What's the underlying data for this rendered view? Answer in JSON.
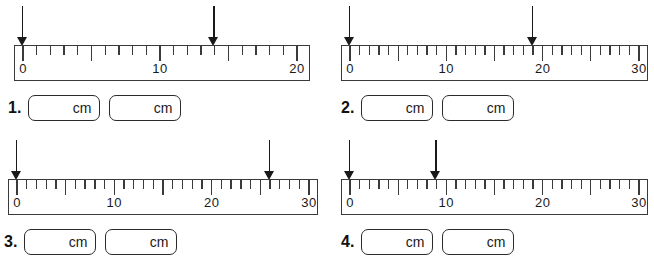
{
  "worksheet": {
    "unit_label": "cm",
    "problems": [
      {
        "number": "1.",
        "ruler": {
          "min": 0,
          "max": 20,
          "tick_step": 1,
          "major_step": 5,
          "labels": [
            {
              "value": 0,
              "text": "0"
            },
            {
              "value": 10,
              "text": "10"
            },
            {
              "value": 20,
              "text": "20"
            }
          ]
        },
        "arrows": [
          0,
          14
        ],
        "answers": [
          {
            "value": "",
            "unit": "cm"
          },
          {
            "value": "",
            "unit": "cm"
          }
        ]
      },
      {
        "number": "2.",
        "ruler": {
          "min": 0,
          "max": 30,
          "tick_step": 1,
          "major_step": 5,
          "labels": [
            {
              "value": 0,
              "text": "0"
            },
            {
              "value": 10,
              "text": "10"
            },
            {
              "value": 20,
              "text": "20"
            },
            {
              "value": 30,
              "text": "30"
            }
          ]
        },
        "arrows": [
          0,
          19
        ],
        "answers": [
          {
            "value": "",
            "unit": "cm"
          },
          {
            "value": "",
            "unit": "cm"
          }
        ]
      },
      {
        "number": "3.",
        "ruler": {
          "min": 0,
          "max": 30,
          "tick_step": 1,
          "major_step": 5,
          "labels": [
            {
              "value": 0,
              "text": "0"
            },
            {
              "value": 10,
              "text": "10"
            },
            {
              "value": 20,
              "text": "20"
            },
            {
              "value": 30,
              "text": "30"
            }
          ]
        },
        "arrows": [
          0,
          26
        ],
        "answers": [
          {
            "value": "",
            "unit": "cm"
          },
          {
            "value": "",
            "unit": "cm"
          }
        ]
      },
      {
        "number": "4.",
        "ruler": {
          "min": 0,
          "max": 30,
          "tick_step": 1,
          "major_step": 5,
          "labels": [
            {
              "value": 0,
              "text": "0"
            },
            {
              "value": 10,
              "text": "10"
            },
            {
              "value": 20,
              "text": "20"
            },
            {
              "value": 30,
              "text": "30"
            }
          ]
        },
        "arrows": [
          0,
          9
        ],
        "answers": [
          {
            "value": "",
            "unit": "cm"
          },
          {
            "value": "",
            "unit": "cm"
          }
        ]
      }
    ]
  }
}
